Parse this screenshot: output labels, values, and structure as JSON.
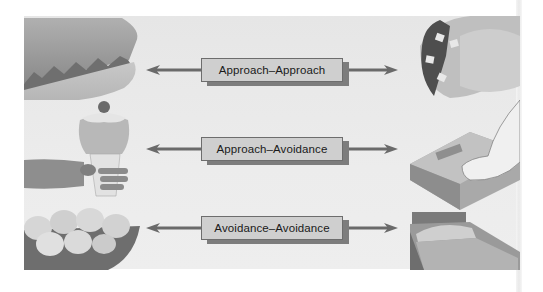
{
  "diagram": {
    "conflicts": [
      {
        "label": "Approach–Approach",
        "left_item": "taco shell / pie slice (desirable)",
        "right_item": "taco (desirable)"
      },
      {
        "label": "Approach–Avoidance",
        "left_item": "ice cream sundae (desirable)",
        "right_item": "bathroom scale (undesirable)"
      },
      {
        "label": "Avoidance–Avoidance",
        "left_item": "bowl of eggshells / chores (undesirable)",
        "right_item": "unmade bed (undesirable)"
      }
    ],
    "colors": {
      "background": "#e8e8e8",
      "label_fill": "#cfcfcf",
      "label_border": "#6d6d6d",
      "label_shadow": "#7d7d7d",
      "arrow": "#6a6a6a"
    }
  }
}
